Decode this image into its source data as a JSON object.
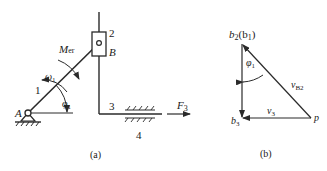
{
  "figure_a": {
    "caption": "(a)",
    "labels": {
      "pivot": "A",
      "slider_joint": "B",
      "link1": "1",
      "slider2": "2",
      "member3": "3",
      "ground4": "4",
      "moment": "M",
      "moment_sub": "er",
      "omega": "ω",
      "omega_sub": "1",
      "phi": "φ",
      "phi_sub": "1",
      "force": "F",
      "force_sub": "3"
    }
  },
  "figure_b": {
    "caption": "(b)",
    "labels": {
      "top_vertex": "b",
      "top_vertex_sub": "2",
      "top_vertex_paren": "(b",
      "top_vertex_paren_sub": "1",
      "top_vertex_close": ")",
      "bottom_vertex": "b",
      "bottom_vertex_sub": "3",
      "pole": "p",
      "hyp_vel": "v",
      "hyp_vel_sub": "B2",
      "horiz_vel": "v",
      "horiz_vel_sub": "3",
      "angle": "φ",
      "angle_sub": "1"
    }
  },
  "colors": {
    "line": "#2a2a2a",
    "text": "#1a1a1a",
    "background": "#ffffff"
  }
}
